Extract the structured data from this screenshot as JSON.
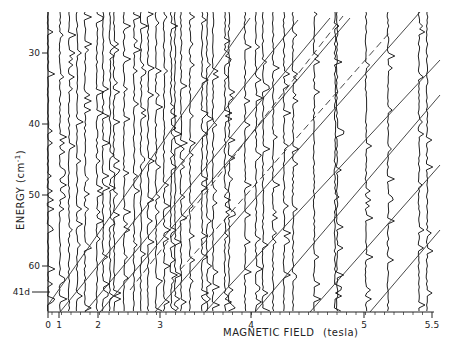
{
  "chart_data": {
    "type": "line",
    "title": "",
    "xlabel": "MAGNETIC FIELD",
    "xlabel_unit": "(tesla)",
    "ylabel": "ENERGY (cm⁻¹)",
    "x_ticks": [
      {
        "label": "0",
        "value": 0,
        "px": 48
      },
      {
        "label": "1",
        "value": 1,
        "px": 59
      },
      {
        "label": "2",
        "value": 2,
        "px": 98
      },
      {
        "label": "3",
        "value": 3,
        "px": 160
      },
      {
        "label": "4",
        "value": 4,
        "px": 251
      },
      {
        "label": "5",
        "value": 5,
        "px": 364
      },
      {
        "label": "5.5",
        "value": 5.5,
        "px": 432
      }
    ],
    "y_ticks": [
      {
        "label": "30",
        "value": 30,
        "px": 53
      },
      {
        "label": "40",
        "value": 40,
        "px": 124
      },
      {
        "label": "50",
        "value": 50,
        "px": 195
      },
      {
        "label": "60",
        "value": 60,
        "px": 266
      }
    ],
    "y_annotation": {
      "label": "41d",
      "px": 292
    },
    "ylim": [
      25,
      68
    ],
    "y_inverted": true,
    "grid": false,
    "legend": null,
    "spectra_traces_x_px": [
      48,
      60,
      69,
      77,
      85,
      97,
      103,
      110,
      114,
      124,
      134,
      141,
      148,
      156,
      164,
      171,
      175,
      181,
      190,
      202,
      207,
      213,
      225,
      229,
      245,
      256,
      263,
      273,
      284,
      293,
      314,
      335,
      337,
      366,
      388,
      419,
      427
    ],
    "fan_lines": [
      {
        "style": "solid",
        "x1": 48,
        "y1": 305,
        "x2": 250,
        "y2": 18
      },
      {
        "style": "solid",
        "x1": 60,
        "y1": 312,
        "x2": 298,
        "y2": 20
      },
      {
        "style": "solid",
        "x1": 85,
        "y1": 312,
        "x2": 330,
        "y2": 18
      },
      {
        "style": "dashed",
        "x1": 130,
        "y1": 290,
        "x2": 343,
        "y2": 16
      },
      {
        "style": "solid",
        "x1": 100,
        "y1": 312,
        "x2": 350,
        "y2": 18
      },
      {
        "style": "dashed",
        "x1": 180,
        "y1": 270,
        "x2": 390,
        "y2": 32
      },
      {
        "style": "solid",
        "x1": 155,
        "y1": 312,
        "x2": 420,
        "y2": 12
      },
      {
        "style": "solid",
        "x1": 205,
        "y1": 312,
        "x2": 440,
        "y2": 60
      },
      {
        "style": "solid",
        "x1": 255,
        "y1": 312,
        "x2": 440,
        "y2": 95
      },
      {
        "style": "solid",
        "x1": 310,
        "y1": 312,
        "x2": 440,
        "y2": 165
      },
      {
        "style": "solid",
        "x1": 370,
        "y1": 312,
        "x2": 440,
        "y2": 230
      }
    ]
  },
  "axes": {
    "x_title": "MAGNETIC FIELD",
    "x_unit": "(tesla)",
    "y_title": "ENERGY (cm",
    "y_title_sup": "-1",
    "y_title_close": ")"
  }
}
